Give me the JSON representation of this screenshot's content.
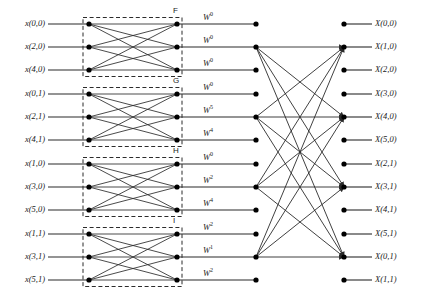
{
  "figure": {
    "background": "#ffffff",
    "line_color": "#2b2b2b",
    "node_color": "#000000"
  },
  "geometry": {
    "rows_y": [
      24,
      47,
      70,
      94,
      117,
      140,
      164,
      187,
      210,
      234,
      257,
      280
    ],
    "stage1_box_left": 83,
    "stage1_box_right": 182,
    "stage1_node_left_x": 89,
    "stage1_node_right_x": 177,
    "mid_node_x": 256,
    "right_node_x": 344,
    "input_line_start_x": 48,
    "output_line_end_x": 372,
    "active_rows": [
      1,
      4,
      7,
      10
    ]
  },
  "inputs": [
    {
      "label": "x(0,0)",
      "row": 0
    },
    {
      "label": "x(2,0)",
      "row": 1
    },
    {
      "label": "x(4,0)",
      "row": 2
    },
    {
      "label": "x(0,1)",
      "row": 3
    },
    {
      "label": "x(2,1)",
      "row": 4
    },
    {
      "label": "x(4,1)",
      "row": 5
    },
    {
      "label": "x(1,0)",
      "row": 6
    },
    {
      "label": "x(3,0)",
      "row": 7
    },
    {
      "label": "x(5,0)",
      "row": 8
    },
    {
      "label": "x(1,1)",
      "row": 9
    },
    {
      "label": "x(3,1)",
      "row": 10
    },
    {
      "label": "x(5,1)",
      "row": 11
    }
  ],
  "twiddles": [
    {
      "base": "W",
      "exp": "0",
      "row": 0
    },
    {
      "base": "W",
      "exp": "0",
      "row": 1
    },
    {
      "base": "W",
      "exp": "0",
      "row": 2
    },
    {
      "base": "W",
      "exp": "0",
      "row": 3
    },
    {
      "base": "W",
      "exp": "5",
      "row": 4
    },
    {
      "base": "W",
      "exp": "4",
      "row": 5
    },
    {
      "base": "W",
      "exp": "0",
      "row": 6
    },
    {
      "base": "W",
      "exp": "2",
      "row": 7
    },
    {
      "base": "W",
      "exp": "4",
      "row": 8
    },
    {
      "base": "W",
      "exp": "2",
      "row": 9
    },
    {
      "base": "W",
      "exp": "1",
      "row": 10
    },
    {
      "base": "W",
      "exp": "2",
      "row": 11
    }
  ],
  "outputs": [
    {
      "label": "X(0,0)",
      "row": 0
    },
    {
      "label": "X(1,0)",
      "row": 1
    },
    {
      "label": "X(2,0)",
      "row": 2
    },
    {
      "label": "X(3,0)",
      "row": 3
    },
    {
      "label": "X(4,0)",
      "row": 4
    },
    {
      "label": "X(5,0)",
      "row": 5
    },
    {
      "label": "X(2,1)",
      "row": 6
    },
    {
      "label": "X(3,1)",
      "row": 7
    },
    {
      "label": "X(4,1)",
      "row": 8
    },
    {
      "label": "X(5,1)",
      "row": 9
    },
    {
      "label": "X(0,1)",
      "row": 10
    },
    {
      "label": "X(1,1)",
      "row": 11
    }
  ],
  "blocks": [
    {
      "name": "F",
      "rows": [
        0,
        1,
        2
      ]
    },
    {
      "name": "G",
      "rows": [
        3,
        4,
        5
      ]
    },
    {
      "name": "H",
      "rows": [
        6,
        7,
        8
      ]
    },
    {
      "name": "I",
      "rows": [
        9,
        10,
        11
      ]
    }
  ]
}
